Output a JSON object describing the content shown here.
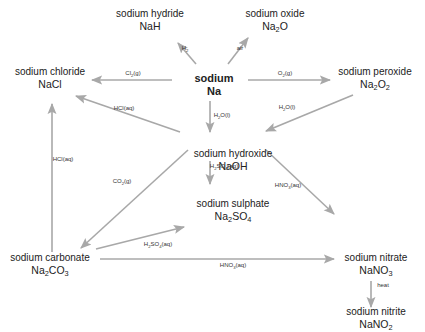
{
  "diagram": {
    "colors": {
      "arrow": "#a8a8a8",
      "text": "#222222"
    },
    "nodes": [
      {
        "id": "na",
        "name": "sodium",
        "formula": "Na",
        "center": true
      },
      {
        "id": "nah",
        "name": "sodium hydride",
        "formula": "NaH"
      },
      {
        "id": "na2o",
        "name": "sodium oxide",
        "formula": "Na_2O"
      },
      {
        "id": "nacl",
        "name": "sodium chloride",
        "formula": "NaCl"
      },
      {
        "id": "na2o2",
        "name": "sodium peroxide",
        "formula": "Na_2O_2"
      },
      {
        "id": "naoh",
        "name": "sodium hydroxide",
        "formula": "NaOH"
      },
      {
        "id": "na2so4",
        "name": "sodium sulphate",
        "formula": "Na_2SO_4"
      },
      {
        "id": "na2co3",
        "name": "sodium carbonate",
        "formula": "Na_2CO_3"
      },
      {
        "id": "nano3",
        "name": "sodium nitrate",
        "formula": "NaNO_3"
      },
      {
        "id": "nano2",
        "name": "sodium nitrite",
        "formula": "NaNO_2"
      }
    ],
    "edges": [
      {
        "from": "na",
        "to": "nah",
        "reagent": "H_2"
      },
      {
        "from": "na",
        "to": "na2o",
        "reagent": "air"
      },
      {
        "from": "na",
        "to": "nacl",
        "reagent": "Cl_2(g)"
      },
      {
        "from": "na",
        "to": "na2o2",
        "reagent": "O_2(g)"
      },
      {
        "from": "na",
        "to": "naoh",
        "reagent": "H_2O(l)"
      },
      {
        "from": "na2o2",
        "to": "naoh",
        "reagent": "H_2O(l)"
      },
      {
        "from": "naoh",
        "to": "nacl",
        "reagent": "HCl(aq)"
      },
      {
        "from": "naoh",
        "to": "na2so4",
        "reagent": "H_2SO_4(aq)"
      },
      {
        "from": "naoh",
        "to": "na2co3",
        "reagent": "CO_2(g)"
      },
      {
        "from": "naoh",
        "to": "nano3",
        "reagent": "HNO_3(aq)"
      },
      {
        "from": "na2co3",
        "to": "nacl",
        "reagent": "HCl(aq)"
      },
      {
        "from": "na2co3",
        "to": "na2so4",
        "reagent": "H_2SO_4(aq)"
      },
      {
        "from": "na2co3",
        "to": "nano3",
        "reagent": "HNO_3(aq)"
      },
      {
        "from": "nano3",
        "to": "nano2",
        "reagent": "heat"
      }
    ]
  }
}
